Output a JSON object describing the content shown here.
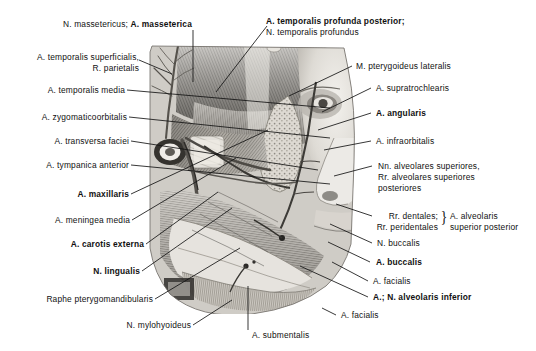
{
  "figure": {
    "kind": "anatomical-illustration",
    "region": "lateral face / infratemporal fossa dissection",
    "palette": {
      "background": "#ffffff",
      "text": "#111111",
      "leader_line": "#1a1a1a",
      "art_light": "#e8e6e2",
      "art_mid": "#a9a6a1",
      "art_dark": "#4a4743",
      "art_deep": "#232221"
    }
  },
  "labels": {
    "masterericus": {
      "text": "N. massetericus;",
      "bold_text": "A. masseterica"
    },
    "temporalis_profunda": {
      "line1": "A. temporalis profunda posterior;",
      "line2": "N. temporalis profundus"
    },
    "temporalis_superficialis": {
      "line1": "A. temporalis superficialis,",
      "line2": "R. parietalis"
    },
    "pterygoideus_lateralis": {
      "text": "M. pterygoideus lateralis"
    },
    "temporalis_media": {
      "text": "A. temporalis media"
    },
    "supratrochlearis": {
      "text": "A. supratrochlearis"
    },
    "zygomaticoorbitalis": {
      "text": "A. zygomaticoorbitalis"
    },
    "angularis": {
      "text": "A. angularis"
    },
    "transversa_faciei": {
      "text": "A. transversa faciei"
    },
    "infraorbitalis": {
      "text": "A. infraorbitalis"
    },
    "tympanica_anterior": {
      "text": "A. tympanica anterior"
    },
    "alveolares_superiores": {
      "line1": "Nn. alveolares superiores,",
      "line2": "Rr. alveolares superiores",
      "line3": "posteriores"
    },
    "maxillaris": {
      "text": "A. maxillaris"
    },
    "meningea_media": {
      "text": "A. meningea media"
    },
    "dentales": {
      "line1": "Rr. dentales;",
      "line2": "Rr. peridentales",
      "brace": "}"
    },
    "alveolaris_sup_post": {
      "line1": "A. alveolaris",
      "line2": "superior posterior"
    },
    "carotis_externa": {
      "text": "A. carotis externa"
    },
    "buccalis_n": {
      "text": "N. buccalis"
    },
    "lingualis": {
      "text": "N. lingualis"
    },
    "buccalis_a": {
      "text": "A. buccalis"
    },
    "facialis_1": {
      "text": "A. facialis"
    },
    "raphe": {
      "text": "Raphe pterygomandibularis"
    },
    "alveolaris_inferior": {
      "text": "A.; N. alveolaris inferior"
    },
    "mylohyoideus": {
      "text": "N. mylohyoideus"
    },
    "facialis_2": {
      "text": "A. facialis"
    },
    "submentalis": {
      "text": "A. submentalis"
    }
  }
}
